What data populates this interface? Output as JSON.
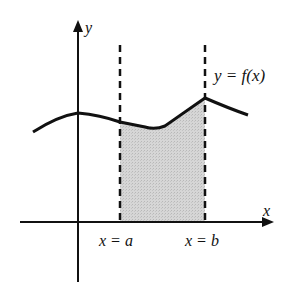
{
  "diagram": {
    "type": "area-under-curve",
    "labels": {
      "y_axis": "y",
      "x_axis": "x",
      "curve": "y = f(x)",
      "left_bound": "x = a",
      "right_bound": "x = b"
    },
    "colors": {
      "stroke": "#111111",
      "shade": "#d0d0d0"
    }
  }
}
